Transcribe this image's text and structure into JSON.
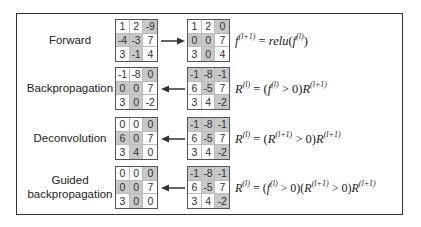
{
  "rows": [
    {
      "label": "Forward",
      "arrow_direction": "right",
      "left_matrix": [
        [
          "1",
          "2",
          "-9"
        ],
        [
          "-4",
          "-3",
          "7"
        ],
        [
          "3",
          "-1",
          "4"
        ]
      ],
      "left_shade": [
        [
          0,
          0,
          1
        ],
        [
          1,
          1,
          0
        ],
        [
          0,
          1,
          0
        ]
      ],
      "right_matrix": [
        [
          "1",
          "2",
          "0"
        ],
        [
          "0",
          "0",
          "7"
        ],
        [
          "3",
          "0",
          "4"
        ]
      ],
      "right_shade": [
        [
          0,
          0,
          1
        ],
        [
          1,
          1,
          0
        ],
        [
          0,
          1,
          0
        ]
      ],
      "formula": {
        "lhs": "f",
        "lhs_sup": "(l+1)",
        "eq": " = ",
        "rhs": "relu(f",
        "rhs_sup": "(l)",
        "rhs_end": ")"
      }
    },
    {
      "label": "Backpropagation",
      "arrow_direction": "left",
      "left_matrix": [
        [
          "-1",
          "-8",
          "0"
        ],
        [
          "0",
          "0",
          "7"
        ],
        [
          "3",
          "0",
          "-2"
        ]
      ],
      "left_shade": [
        [
          0,
          0,
          1
        ],
        [
          1,
          1,
          0
        ],
        [
          0,
          1,
          0
        ]
      ],
      "right_matrix": [
        [
          "-1",
          "-8",
          "-1"
        ],
        [
          "6",
          "-5",
          "7"
        ],
        [
          "3",
          "4",
          "-2"
        ]
      ],
      "right_shade": [
        [
          1,
          1,
          1
        ],
        [
          0,
          1,
          0
        ],
        [
          0,
          0,
          1
        ]
      ],
      "formula": {
        "text": "R(l) = (f(l) > 0)R(l+1)"
      }
    },
    {
      "label": "Deconvolution",
      "arrow_direction": "left",
      "left_matrix": [
        [
          "0",
          "0",
          "0"
        ],
        [
          "6",
          "0",
          "7"
        ],
        [
          "3",
          "4",
          "0"
        ]
      ],
      "left_shade": [
        [
          0,
          0,
          1
        ],
        [
          1,
          1,
          0
        ],
        [
          0,
          1,
          0
        ]
      ],
      "right_matrix": [
        [
          "-1",
          "-8",
          "-1"
        ],
        [
          "6",
          "-5",
          "7"
        ],
        [
          "3",
          "4",
          "-2"
        ]
      ],
      "right_shade": [
        [
          1,
          1,
          1
        ],
        [
          0,
          1,
          0
        ],
        [
          0,
          0,
          1
        ]
      ],
      "formula": {
        "text": "R(l) = (R(l+1) > 0)R(l+1)"
      }
    },
    {
      "label_line1": "Guided",
      "label_line2": "backpropagation",
      "arrow_direction": "left",
      "left_matrix": [
        [
          "0",
          "0",
          "0"
        ],
        [
          "0",
          "0",
          "7"
        ],
        [
          "3",
          "0",
          "0"
        ]
      ],
      "left_shade": [
        [
          0,
          0,
          1
        ],
        [
          1,
          1,
          0
        ],
        [
          0,
          1,
          0
        ]
      ],
      "right_matrix": [
        [
          "-1",
          "-8",
          "-1"
        ],
        [
          "6",
          "-5",
          "7"
        ],
        [
          "3",
          "4",
          "-2"
        ]
      ],
      "right_shade": [
        [
          1,
          1,
          1
        ],
        [
          0,
          1,
          0
        ],
        [
          0,
          0,
          1
        ]
      ],
      "formula": {
        "text": "R(l) = (f(l) > 0)(R(l+1) > 0)R(l+1)"
      }
    }
  ],
  "colors": {
    "shade": "#c8c8c8",
    "border": "#555555",
    "frame": "#333333"
  }
}
